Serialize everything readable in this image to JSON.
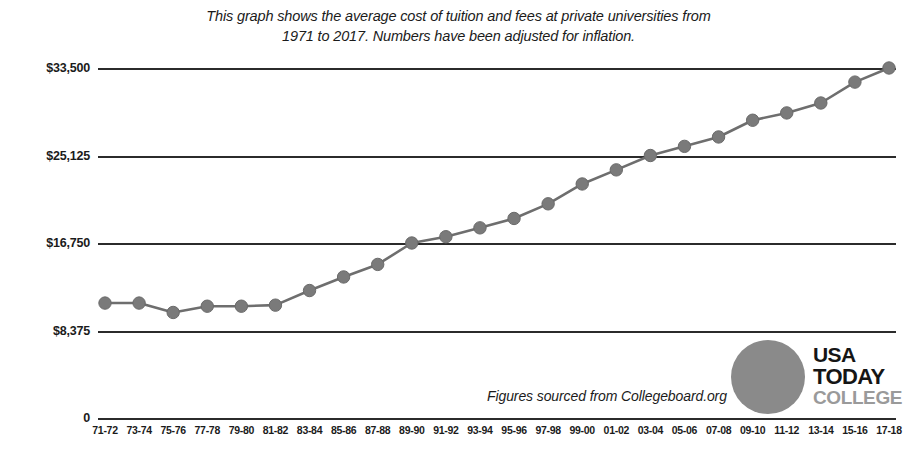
{
  "title": {
    "line1": "This graph shows the average cost of tuition and fees at private universities from",
    "line2": "1971 to 2017. Numbers have been adjusted for inflation."
  },
  "source_note": "Figures sourced from Collegeboard.org",
  "logo": {
    "usa": "USA",
    "today": "TODAY",
    "college": "COLLEGE",
    "circle_color": "#8a8a8a",
    "wordmark_color": "#151515",
    "college_color": "#9a9a9a"
  },
  "colors": {
    "line": "#6e6e6e",
    "marker": "#7a7a7a",
    "gridline": "#2b2b2b",
    "text": "#1b1b1b",
    "background": "#ffffff"
  },
  "chart_data": {
    "type": "line",
    "title": "This graph shows the average cost of tuition and fees at private universities from 1971 to 2017. Numbers have been adjusted for inflation.",
    "xlabel": "",
    "ylabel": "",
    "ylim": [
      0,
      33500
    ],
    "ytick_values": [
      33500,
      25125,
      16750,
      8375,
      0
    ],
    "ytick_labels": [
      "$33,500",
      "$25,125",
      "$16,750",
      "$8,375",
      "0"
    ],
    "grid": true,
    "legend": "none",
    "annotation": "Figures sourced from Collegeboard.org",
    "categories": [
      "71-72",
      "73-74",
      "75-76",
      "77-78",
      "79-80",
      "81-82",
      "83-84",
      "85-86",
      "87-88",
      "89-90",
      "91-92",
      "93-94",
      "95-96",
      "97-98",
      "99-00",
      "01-02",
      "03-04",
      "05-06",
      "07-08",
      "09-10",
      "11-12",
      "13-14",
      "15-16",
      "17-18"
    ],
    "values": [
      11000,
      11000,
      10100,
      10700,
      10700,
      10800,
      12200,
      13500,
      14700,
      16750,
      17350,
      18200,
      19100,
      20500,
      22400,
      23750,
      25125,
      26000,
      26900,
      28500,
      29200,
      30150,
      32150,
      33500
    ],
    "series": [
      {
        "name": "Average cost of tuition and fees at private universities",
        "values": [
          11000,
          11000,
          10100,
          10700,
          10700,
          10800,
          12200,
          13500,
          14700,
          16750,
          17350,
          18200,
          19100,
          20500,
          22400,
          23750,
          25125,
          26000,
          26900,
          28500,
          29200,
          30150,
          32150,
          33500
        ]
      }
    ]
  }
}
